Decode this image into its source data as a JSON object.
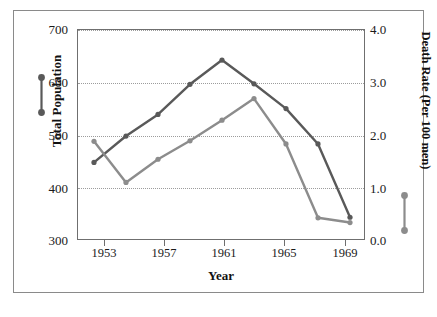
{
  "chart_data": {
    "type": "line",
    "title": "",
    "xlabel": "Year",
    "ylabel": "Total Population",
    "ylabel_right": "Death Rate (Per 100 men)",
    "x": [
      1953,
      1955,
      1957,
      1959,
      1961,
      1963,
      1965,
      1967,
      1969
    ],
    "xlim": [
      1952,
      1970
    ],
    "xticks": [
      1953,
      1957,
      1961,
      1965,
      1969
    ],
    "xtick_labels": [
      "1953",
      "1957",
      "1961",
      "1965",
      "1969"
    ],
    "ylim": [
      300,
      700
    ],
    "yticks": [
      300,
      400,
      500,
      600,
      700
    ],
    "ytick_labels": [
      "300",
      "400",
      "500",
      "600",
      "700"
    ],
    "ylim_right": [
      0.0,
      4.0
    ],
    "yticks_right": [
      0.0,
      1.0,
      2.0,
      3.0,
      4.0
    ],
    "ytick_labels_right": [
      "0.0",
      "1.0",
      "2.0",
      "3.0",
      "4.0"
    ],
    "grid": true,
    "grid_style": "dotted",
    "legend_position": "axis-labels",
    "series": [
      {
        "name": "Total Population",
        "axis": "left",
        "color": "#595959",
        "marker": "circle",
        "values": [
          449,
          499,
          540,
          597,
          643,
          598,
          551,
          484,
          345
        ]
      },
      {
        "name": "Death Rate (Per 100 men)",
        "axis": "right",
        "color": "#8c8c8c",
        "marker": "circle",
        "values": [
          1.89,
          1.11,
          1.55,
          1.9,
          2.29,
          2.7,
          1.84,
          0.44,
          0.35
        ]
      }
    ]
  },
  "axis_left": {
    "label": "Total Population",
    "ticks": [
      "700",
      "600",
      "500",
      "400",
      "300"
    ]
  },
  "axis_right": {
    "label": "Death Rate (Per 100 men)",
    "ticks": [
      "4.0",
      "3.0",
      "2.0",
      "1.0",
      "0.0"
    ]
  },
  "axis_bottom": {
    "label": "Year",
    "ticks": [
      "1953",
      "1957",
      "1961",
      "1965",
      "1969"
    ]
  },
  "colors": {
    "series_dark": "#595959",
    "series_light": "#8c8c8c",
    "grid": "#9c9c9c",
    "axis": "#6f6f6f",
    "frame": "#8a8a8a",
    "text": "#111111"
  }
}
